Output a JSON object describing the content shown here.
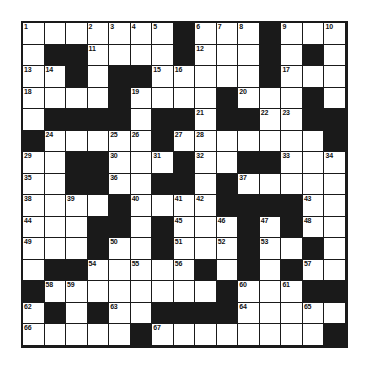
{
  "puzzle": {
    "title": "Crossword Grid",
    "type": "crossword",
    "rows": 15,
    "cols": 15,
    "colors": {
      "block": "#1a1a1a",
      "cell": "#ffffff",
      "number": "#111111",
      "background": "#ffffff"
    },
    "grid": [
      [
        "w",
        "w",
        "w",
        "w",
        "w",
        "w",
        "w",
        "b",
        "w",
        "w",
        "w",
        "b",
        "w",
        "w",
        "w"
      ],
      [
        "w",
        "b",
        "b",
        "w",
        "w",
        "w",
        "w",
        "b",
        "w",
        "w",
        "w",
        "b",
        "w",
        "b",
        "w"
      ],
      [
        "w",
        "w",
        "b",
        "w",
        "b",
        "b",
        "w",
        "w",
        "w",
        "w",
        "w",
        "b",
        "w",
        "w",
        "w"
      ],
      [
        "w",
        "w",
        "w",
        "w",
        "b",
        "w",
        "w",
        "w",
        "w",
        "b",
        "w",
        "w",
        "w",
        "b",
        "w"
      ],
      [
        "w",
        "b",
        "b",
        "b",
        "b",
        "w",
        "b",
        "b",
        "w",
        "b",
        "b",
        "w",
        "w",
        "b",
        "b"
      ],
      [
        "b",
        "w",
        "w",
        "w",
        "w",
        "w",
        "b",
        "w",
        "w",
        "w",
        "w",
        "w",
        "w",
        "w",
        "b"
      ],
      [
        "w",
        "w",
        "b",
        "b",
        "w",
        "w",
        "w",
        "b",
        "w",
        "w",
        "b",
        "b",
        "w",
        "w",
        "w"
      ],
      [
        "w",
        "w",
        "b",
        "b",
        "w",
        "w",
        "b",
        "b",
        "w",
        "b",
        "w",
        "w",
        "w",
        "w",
        "w"
      ],
      [
        "w",
        "w",
        "w",
        "w",
        "b",
        "w",
        "w",
        "w",
        "w",
        "b",
        "b",
        "b",
        "b",
        "w",
        "w"
      ],
      [
        "w",
        "w",
        "w",
        "b",
        "b",
        "w",
        "b",
        "w",
        "w",
        "w",
        "b",
        "w",
        "b",
        "w",
        "w"
      ],
      [
        "w",
        "w",
        "w",
        "b",
        "w",
        "w",
        "b",
        "w",
        "w",
        "w",
        "b",
        "w",
        "w",
        "b",
        "w"
      ],
      [
        "w",
        "b",
        "b",
        "w",
        "w",
        "w",
        "w",
        "w",
        "b",
        "w",
        "b",
        "w",
        "b",
        "w",
        "w"
      ],
      [
        "b",
        "w",
        "w",
        "w",
        "w",
        "w",
        "w",
        "w",
        "w",
        "b",
        "w",
        "w",
        "w",
        "b",
        "b"
      ],
      [
        "w",
        "b",
        "w",
        "b",
        "w",
        "w",
        "b",
        "b",
        "b",
        "b",
        "w",
        "w",
        "w",
        "w",
        "w"
      ],
      [
        "w",
        "w",
        "w",
        "w",
        "w",
        "b",
        "w",
        "w",
        "w",
        "w",
        "w",
        "w",
        "w",
        "w",
        "b"
      ]
    ],
    "numbers": {
      "0_0": "1",
      "0_3": "2",
      "0_4": "3",
      "0_5": "4",
      "0_6": "5",
      "0_8": "6",
      "0_9": "7",
      "0_10": "8",
      "0_12": "9",
      "0_14": "10",
      "1_3": "11",
      "1_8": "12",
      "2_0": "13",
      "2_1": "14",
      "2_6": "15",
      "2_7": "16",
      "2_12": "17",
      "3_0": "18",
      "3_5": "19",
      "3_10": "20",
      "4_8": "21",
      "4_11": "22",
      "4_12": "23",
      "5_1": "24",
      "5_4": "25",
      "5_5": "26",
      "5_7": "27",
      "5_8": "28",
      "6_0": "29",
      "6_4": "30",
      "6_6": "31",
      "6_8": "32",
      "6_12": "33",
      "6_14": "34",
      "7_0": "35",
      "7_4": "36",
      "7_10": "37",
      "8_0": "38",
      "8_2": "39",
      "8_5": "40",
      "8_7": "41",
      "8_8": "42",
      "8_13": "43",
      "9_0": "44",
      "9_7": "45",
      "9_9": "46",
      "9_11": "47",
      "9_13": "48",
      "10_0": "49",
      "10_4": "50",
      "10_7": "51",
      "10_9": "52",
      "10_11": "53",
      "11_3": "54",
      "11_5": "55",
      "11_7": "56",
      "11_13": "57",
      "12_1": "58",
      "12_2": "59",
      "12_10": "60",
      "12_12": "61",
      "13_0": "62",
      "13_4": "63",
      "13_10": "64",
      "13_13": "65",
      "14_0": "66",
      "14_6": "67"
    }
  }
}
